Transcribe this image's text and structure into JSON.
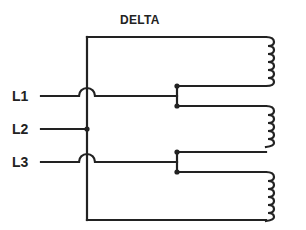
{
  "diagram": {
    "title": "DELTA",
    "lines": [
      {
        "label": "L1",
        "y": 96
      },
      {
        "label": "L2",
        "y": 129
      },
      {
        "label": "L3",
        "y": 162
      }
    ],
    "coils": [
      {
        "name": "coil-1",
        "top": 37,
        "bottom": 86
      },
      {
        "name": "coil-2",
        "top": 106,
        "bottom": 152
      },
      {
        "name": "coil-3",
        "top": 172,
        "bottom": 220
      }
    ],
    "junctions": [
      {
        "name": "junction-l1",
        "x": 177,
        "y1": 86,
        "y2": 106
      },
      {
        "name": "junction-l3",
        "x": 177,
        "y1": 152,
        "y2": 172
      },
      {
        "name": "junction-l2",
        "x": 87,
        "y": 129
      }
    ],
    "colors": {
      "ink": "#222222",
      "background": "#ffffff"
    }
  }
}
